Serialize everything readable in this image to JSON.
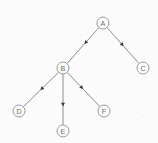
{
  "diagram": {
    "kind": "directed-tree",
    "title": "",
    "background_color": "#fbfbfb",
    "node_stroke_color": "#9a9a9a",
    "node_fill_color": "#fcfcfc",
    "label_color": "#6d6d6d",
    "edge_color": "#8e8e8e",
    "arrow_color": "#3a3a3a",
    "node_radius": 6,
    "nodes": [
      {
        "id": "A",
        "label": "A",
        "x": 103,
        "y": 23
      },
      {
        "id": "B",
        "label": "B",
        "x": 63,
        "y": 68
      },
      {
        "id": "C",
        "label": "C",
        "x": 143,
        "y": 68
      },
      {
        "id": "D",
        "label": "D",
        "x": 19,
        "y": 111
      },
      {
        "id": "E",
        "label": "E",
        "x": 63,
        "y": 131
      },
      {
        "id": "F",
        "label": "F",
        "x": 104,
        "y": 111
      }
    ],
    "edges": [
      {
        "id": "A-B",
        "from": "A",
        "to": "B",
        "directed": true,
        "arrow_position": 0.42
      },
      {
        "id": "A-C",
        "from": "A",
        "to": "C",
        "directed": true,
        "arrow_position": 0.48
      },
      {
        "id": "B-D",
        "from": "B",
        "to": "D",
        "directed": true,
        "arrow_position": 0.48
      },
      {
        "id": "B-E",
        "from": "B",
        "to": "E",
        "directed": true,
        "arrow_position": 0.6
      },
      {
        "id": "B-F",
        "from": "B",
        "to": "F",
        "directed": true,
        "arrow_position": 0.45
      }
    ]
  }
}
